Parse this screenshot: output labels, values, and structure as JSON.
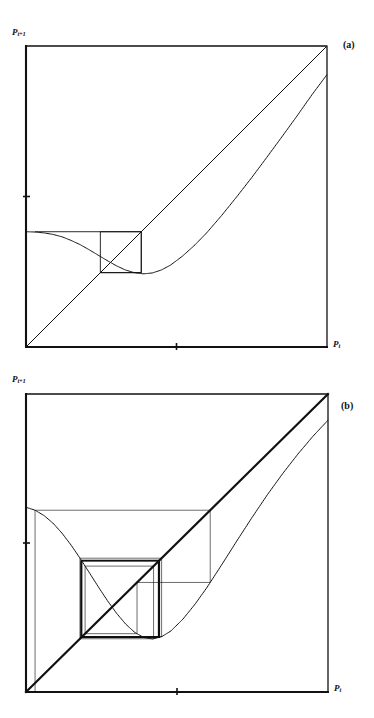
{
  "figure": {
    "background_color": "#ffffff",
    "ink_color": "#111111",
    "width": 374,
    "height": 718
  },
  "panels": [
    {
      "id": "a",
      "tag": "(a)",
      "y_axis_label_base": "P",
      "y_axis_label_sub": "t+1",
      "x_axis_label_base": "P",
      "x_axis_label_sub": "t",
      "frame": {
        "left": 26,
        "top": 46,
        "right": 327,
        "bottom": 347
      },
      "x_ticks": [
        0.5
      ],
      "y_ticks": [
        0.5
      ],
      "description": "Single-humped return map with a small cobweb rectangle near the minimum, indicating a stable 2-cycle."
    },
    {
      "id": "b",
      "tag": "(b)",
      "y_axis_label_base": "P",
      "y_axis_label_sub": "t+1",
      "x_axis_label_base": "P",
      "x_axis_label_sub": "t",
      "frame": {
        "left": 26,
        "top": 34,
        "right": 328,
        "bottom": 332
      },
      "x_ticks": [
        0.5
      ],
      "y_ticks": [
        0.5
      ],
      "description": "Same return map iterated many times, producing a dense chaotic cobweb web."
    }
  ],
  "chart_data": [
    {
      "id": "a",
      "type": "line",
      "title": "(a)",
      "xlabel": "P_t",
      "ylabel": "P_t+1",
      "xlim": [
        0,
        1
      ],
      "ylim": [
        0,
        1
      ],
      "grid": false,
      "legend": "none",
      "series": [
        {
          "name": "diagonal",
          "comment": "identity line P_t+1 = P_t",
          "x": [
            0.0,
            1.0
          ],
          "y": [
            0.0,
            1.0
          ]
        },
        {
          "name": "return_map",
          "comment": "f(P) : flat-topped plateau, dip to a minimum near P=0.38, then rising, slightly below the diagonal at P=1",
          "x": [
            0.0,
            0.03,
            0.06,
            0.09,
            0.12,
            0.15,
            0.18,
            0.21,
            0.24,
            0.27,
            0.3,
            0.33,
            0.36,
            0.39,
            0.42,
            0.45,
            0.48,
            0.52,
            0.56,
            0.6,
            0.65,
            0.7,
            0.75,
            0.8,
            0.85,
            0.9,
            0.95,
            1.0
          ],
          "y": [
            0.383,
            0.382,
            0.379,
            0.374,
            0.366,
            0.354,
            0.34,
            0.323,
            0.305,
            0.287,
            0.27,
            0.256,
            0.247,
            0.243,
            0.246,
            0.256,
            0.272,
            0.302,
            0.338,
            0.379,
            0.437,
            0.499,
            0.563,
            0.63,
            0.698,
            0.767,
            0.838,
            0.905
          ]
        },
        {
          "name": "cobweb",
          "comment": "cobweb orbit in panel (a): converges onto a small 2-cycle box near the minimum",
          "x": [
            0.03,
            0.03,
            0.383,
            0.383,
            0.247,
            0.247,
            0.383,
            0.383,
            0.247
          ],
          "y": [
            0.383,
            0.383,
            0.383,
            0.247,
            0.247,
            0.383,
            0.383,
            0.247,
            0.247
          ]
        }
      ]
    },
    {
      "id": "b",
      "type": "line",
      "title": "(b)",
      "xlabel": "P_t",
      "ylabel": "P_t+1",
      "xlim": [
        0,
        1
      ],
      "ylim": [
        0,
        1
      ],
      "grid": false,
      "legend": "none",
      "series": [
        {
          "name": "diagonal",
          "comment": "identity line P_t+1 = P_t, heavily overdrawn by the cobweb",
          "x": [
            0.0,
            1.0
          ],
          "y": [
            0.0,
            1.0
          ]
        },
        {
          "name": "return_map",
          "comment": "steeper single-humped map: higher left plateau, deeper minimum near P=0.36, returns below diagonal at P=1",
          "x": [
            0.0,
            0.03,
            0.06,
            0.09,
            0.12,
            0.15,
            0.18,
            0.21,
            0.24,
            0.27,
            0.3,
            0.33,
            0.36,
            0.39,
            0.42,
            0.45,
            0.48,
            0.52,
            0.56,
            0.6,
            0.65,
            0.7,
            0.75,
            0.8,
            0.85,
            0.9,
            0.95,
            1.0
          ],
          "y": [
            0.62,
            0.61,
            0.592,
            0.566,
            0.532,
            0.492,
            0.447,
            0.4,
            0.352,
            0.306,
            0.264,
            0.228,
            0.2,
            0.183,
            0.178,
            0.186,
            0.205,
            0.245,
            0.295,
            0.352,
            0.43,
            0.51,
            0.588,
            0.663,
            0.733,
            0.798,
            0.858,
            0.912
          ]
        },
        {
          "name": "cobweb",
          "comment": "chaotic cobweb: many iterates filling a band between the minimum and the left plateau",
          "iterations": 120,
          "x_start": 0.03,
          "x_range": [
            0.178,
            0.62
          ]
        }
      ]
    }
  ]
}
